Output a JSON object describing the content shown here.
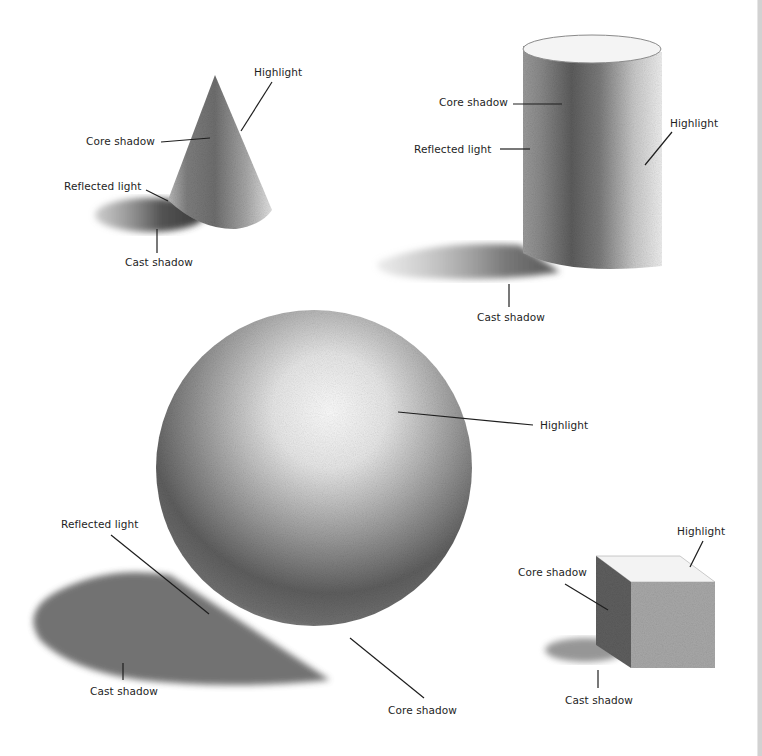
{
  "figure": {
    "colors": {
      "background": "#ffffff",
      "ink": "#1e1e1e",
      "edge_strip": "#d2d2d2"
    },
    "shapes": [
      {
        "name": "cone",
        "labels": {
          "highlight": "Highlight",
          "core_shadow": "Core shadow",
          "reflected_light": "Reflected light",
          "cast_shadow": "Cast shadow"
        }
      },
      {
        "name": "cylinder",
        "labels": {
          "core_shadow": "Core shadow",
          "reflected_light": "Reflected light",
          "highlight": "Highlight",
          "cast_shadow": "Cast shadow"
        }
      },
      {
        "name": "sphere",
        "labels": {
          "highlight": "Highlight",
          "reflected_light": "Reflected light",
          "cast_shadow": "Cast shadow",
          "core_shadow": "Core shadow"
        }
      },
      {
        "name": "cube",
        "labels": {
          "highlight": "Highlight",
          "core_shadow": "Core shadow",
          "cast_shadow": "Cast shadow"
        }
      }
    ]
  }
}
